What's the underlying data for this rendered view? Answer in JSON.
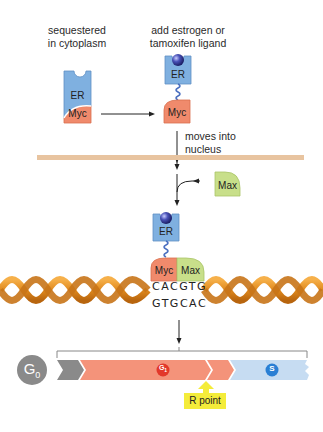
{
  "labels": {
    "sequestered": "sequestered\nin cytoplasm",
    "sequestered_line1": "sequestered",
    "sequestered_line2": "in cytoplasm",
    "add_ligand_line1": "add estrogen or",
    "add_ligand_line2": "tamoxifen ligand",
    "moves_line1": "moves into",
    "moves_line2": "nucleus",
    "r_point": "R point"
  },
  "proteins": {
    "er": "ER",
    "myc": "Myc",
    "max": "Max"
  },
  "dna": {
    "top_strand": "CACGTG",
    "bottom_strand": "GTGCAC"
  },
  "cell_cycle": {
    "g0": "G",
    "g0_sub": "0",
    "g1": "G",
    "g1_sub": "1",
    "s": "S"
  },
  "colors": {
    "er_blue": "#7fb0e0",
    "myc_orange": "#f08a6c",
    "max_green": "#c8df8a",
    "ligand_navy": "#2a2f8a",
    "membrane": "#e8c4a0",
    "dna_orange": "#e8962a",
    "g0_gray": "#8a8a8a",
    "g1_salmon": "#f4937a",
    "g1_badge_red": "#e2382a",
    "s_lightblue": "#c6dcf2",
    "s_badge_blue": "#2a7fd4",
    "r_point_yellow": "#f4ec3a"
  }
}
